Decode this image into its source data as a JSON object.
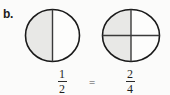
{
  "problem": {
    "label": "b."
  },
  "figures": [
    {
      "name": "circle-halves",
      "parts_total": 2,
      "parts_shaded": 1,
      "division": "vertical",
      "shaded_regions": [
        "left-half"
      ]
    },
    {
      "name": "circle-quarters",
      "parts_total": 4,
      "parts_shaded": 2,
      "division": "vertical-and-horizontal",
      "shaded_regions": [
        "top-left-quadrant",
        "bottom-left-quadrant"
      ]
    }
  ],
  "expression": {
    "left_fraction": {
      "numerator": "1",
      "denominator": "2"
    },
    "operator": "=",
    "right_fraction": {
      "numerator": "2",
      "denominator": "4"
    }
  },
  "colors": {
    "background": "#fbfbfa",
    "outline": "#1a1a1a",
    "shading": "#e8e8e6",
    "unshaded": "#fdfdfc",
    "text": "#1f1f1f",
    "divider": "#3a3a3a"
  }
}
